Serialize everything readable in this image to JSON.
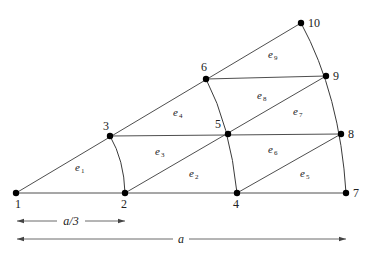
{
  "figure": {
    "nodes": [
      {
        "id": "1",
        "x": 16,
        "y": 193,
        "label_dx": -1,
        "label_dy": 15
      },
      {
        "id": "2",
        "x": 125,
        "y": 193,
        "label_dx": -4,
        "label_dy": 15
      },
      {
        "id": "3",
        "x": 110,
        "y": 136,
        "label_dx": -7,
        "label_dy": -6
      },
      {
        "id": "4",
        "x": 237,
        "y": 193,
        "label_dx": -4,
        "label_dy": 15
      },
      {
        "id": "5",
        "x": 228,
        "y": 134,
        "label_dx": -13,
        "label_dy": -6
      },
      {
        "id": "6",
        "x": 206,
        "y": 79,
        "label_dx": -5,
        "label_dy": -8
      },
      {
        "id": "7",
        "x": 346,
        "y": 193,
        "label_dx": 7,
        "label_dy": 4
      },
      {
        "id": "8",
        "x": 341,
        "y": 134,
        "label_dx": 7,
        "label_dy": 4
      },
      {
        "id": "9",
        "x": 326,
        "y": 76,
        "label_dx": 7,
        "label_dy": 4
      },
      {
        "id": "10",
        "x": 301,
        "y": 23,
        "label_dx": 7,
        "label_dy": 4
      }
    ],
    "elements": [
      {
        "id": "e1",
        "base": "e",
        "sub": "1",
        "x": 75,
        "y": 171
      },
      {
        "id": "e2",
        "base": "e",
        "sub": "2",
        "x": 189,
        "y": 177
      },
      {
        "id": "e3",
        "base": "e",
        "sub": "3",
        "x": 155,
        "y": 155
      },
      {
        "id": "e4",
        "base": "e",
        "sub": "4",
        "x": 173,
        "y": 116
      },
      {
        "id": "e5",
        "base": "e",
        "sub": "5",
        "x": 300,
        "y": 177
      },
      {
        "id": "e6",
        "base": "e",
        "sub": "6",
        "x": 268,
        "y": 153
      },
      {
        "id": "e7",
        "base": "e",
        "sub": "7",
        "x": 293,
        "y": 115
      },
      {
        "id": "e8",
        "base": "e",
        "sub": "8",
        "x": 257,
        "y": 99
      },
      {
        "id": "e9",
        "base": "e",
        "sub": "9",
        "x": 268,
        "y": 58
      }
    ],
    "dimensions": [
      {
        "id": "a-third",
        "label": "a/3",
        "x1": 17,
        "x2": 125,
        "y": 221,
        "label_x": 71
      },
      {
        "id": "a-full",
        "label": "a",
        "x1": 17,
        "x2": 346,
        "y": 239,
        "label_x": 181
      }
    ]
  }
}
